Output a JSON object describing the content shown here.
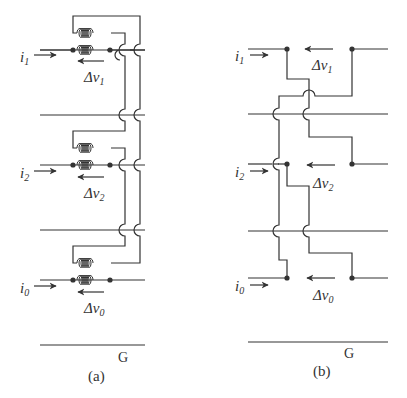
{
  "figure": {
    "panel_a": {
      "caption": "(a)",
      "ground_label": "G",
      "phases": [
        {
          "current_label": "i",
          "current_sub": "1",
          "voltage_label": "Δv",
          "voltage_sub": "1"
        },
        {
          "current_label": "i",
          "current_sub": "2",
          "voltage_label": "Δv",
          "voltage_sub": "2"
        },
        {
          "current_label": "i",
          "current_sub": "0",
          "voltage_label": "Δv",
          "voltage_sub": "0"
        }
      ]
    },
    "panel_b": {
      "caption": "(b)",
      "ground_label": "G",
      "phases": [
        {
          "current_label": "i",
          "current_sub": "1",
          "voltage_label": "Δv",
          "voltage_sub": "1"
        },
        {
          "current_label": "i",
          "current_sub": "2",
          "voltage_label": "Δv",
          "voltage_sub": "2"
        },
        {
          "current_label": "i",
          "current_sub": "0",
          "voltage_label": "Δv",
          "voltage_sub": "0"
        }
      ]
    },
    "colors": {
      "line": "#333333",
      "background": "#ffffff"
    }
  }
}
